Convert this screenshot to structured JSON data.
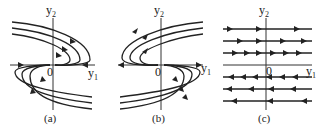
{
  "panels": [
    {
      "id": "a",
      "caption": "(a)",
      "y_axis_label": "y",
      "y_axis_sub": "2",
      "x_axis_label": "y",
      "x_axis_sub": "1",
      "origin_label": "0"
    },
    {
      "id": "b",
      "caption": "(b)",
      "y_axis_label": "y",
      "y_axis_sub": "2",
      "x_axis_label": "y",
      "x_axis_sub": "1",
      "origin_label": "0"
    },
    {
      "id": "c",
      "caption": "(c)",
      "y_axis_label": "y",
      "y_axis_sub": "2",
      "x_axis_label": "y",
      "x_axis_sub": "1",
      "origin_label": "0"
    }
  ],
  "colors": {
    "line": "#222222",
    "background": "#ffffff"
  }
}
